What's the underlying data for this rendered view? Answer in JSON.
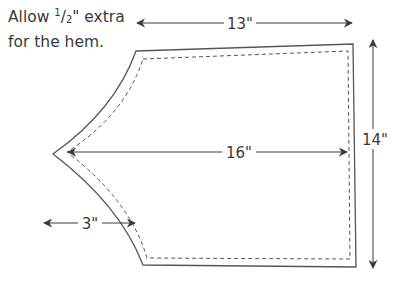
{
  "note": {
    "line1_prefix": "Allow ",
    "fraction_num": "1",
    "fraction_sep": "/",
    "fraction_den": "2",
    "line1_suffix": "\" extra",
    "line2": "for the hem."
  },
  "dimensions": {
    "top_width": "13\"",
    "middle_width": "16\"",
    "height": "14\"",
    "point_depth": "3\""
  },
  "colors": {
    "outline": "#555555",
    "dashed": "#555555",
    "arrow": "#3a3a3a",
    "text": "#3a3a3a"
  }
}
